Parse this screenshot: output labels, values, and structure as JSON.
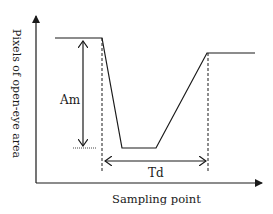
{
  "diagram": {
    "y_axis_label": "Pixels of open-eye area",
    "x_axis_label": "Sampling point",
    "amplitude_label": "Am",
    "duration_label": "Td",
    "colors": {
      "line": "#1a1a1a",
      "background": "#ffffff"
    }
  }
}
